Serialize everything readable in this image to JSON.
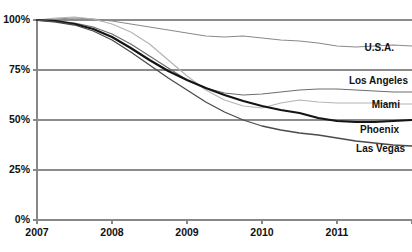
{
  "chart_data": {
    "type": "line",
    "title": "",
    "xlabel": "",
    "ylabel": "",
    "xlim": [
      2007,
      2012
    ],
    "ylim": [
      0,
      100
    ],
    "grid": true,
    "legend_position": "inline-right",
    "x_ticks": [
      "2007",
      "2008",
      "2009",
      "2010",
      "2011"
    ],
    "x_tick_values": [
      2007,
      2008,
      2009,
      2010,
      2011
    ],
    "y_ticks": [
      "0%",
      "25%",
      "50%",
      "75%",
      "100%"
    ],
    "y_tick_values": [
      0,
      25,
      50,
      75,
      100
    ],
    "x": [
      2007.0,
      2007.25,
      2007.5,
      2007.75,
      2008.0,
      2008.25,
      2008.5,
      2008.75,
      2009.0,
      2009.25,
      2009.5,
      2009.75,
      2010.0,
      2010.25,
      2010.5,
      2010.75,
      2011.0,
      2011.25,
      2011.5,
      2011.75,
      2012.0
    ],
    "series": [
      {
        "name": "U.S.A.",
        "color": "#8a8a8a",
        "width": 1.1,
        "label_value": 87,
        "values": [
          100,
          100.5,
          101,
          100.5,
          99.5,
          98,
          96.5,
          95,
          93.5,
          92,
          91.5,
          92,
          91,
          90,
          89.5,
          88.5,
          87,
          86.5,
          87,
          87.5,
          87
        ]
      },
      {
        "name": "Los Angeles",
        "color": "#6e6e6e",
        "width": 1.2,
        "label_value": 64,
        "values": [
          100,
          99.5,
          98.5,
          96.5,
          93,
          88,
          82,
          76,
          70,
          66,
          63.5,
          62.5,
          63,
          64,
          65,
          65.5,
          65.5,
          65,
          64.5,
          64,
          64
        ]
      },
      {
        "name": "Miami",
        "color": "#b4b4b4",
        "width": 1.2,
        "label_value": 58,
        "values": [
          100,
          101,
          101.5,
          100.5,
          98,
          94,
          88,
          80,
          72,
          65,
          60,
          57,
          56,
          58.5,
          60,
          59,
          58.5,
          58.5,
          58.5,
          58,
          58
        ]
      },
      {
        "name": "Phoenix",
        "color": "#141414",
        "width": 2.2,
        "label_value": 50,
        "values": [
          100,
          99.5,
          98,
          95.5,
          91.5,
          86,
          80,
          74.5,
          70,
          66,
          62.5,
          59.5,
          57,
          55,
          53.5,
          51,
          49.5,
          49,
          49,
          49.5,
          50
        ]
      },
      {
        "name": "Las Vegas",
        "color": "#4a4a4a",
        "width": 1.3,
        "label_value": 37,
        "values": [
          100,
          99,
          97.5,
          94.5,
          90,
          84,
          77.5,
          71,
          65,
          59,
          54,
          50,
          47,
          45,
          43.5,
          42.5,
          41,
          39.5,
          38.5,
          37.5,
          37
        ]
      }
    ],
    "series_labels": [
      {
        "name": "U.S.A.",
        "text": "U.S.A.",
        "x": 394,
        "y": 51
      },
      {
        "name": "Los Angeles",
        "text": "Los Angeles",
        "x": 408,
        "y": 84
      },
      {
        "name": "Miami",
        "text": "Miami",
        "x": 400,
        "y": 108
      },
      {
        "name": "Phoenix",
        "text": "Phoenix",
        "x": 399,
        "y": 133
      },
      {
        "name": "Las Vegas",
        "text": "Las Vegas",
        "x": 405,
        "y": 152
      }
    ],
    "axis_color": "#888888",
    "grid_color": "#8c8c8c",
    "text_color": "#111111",
    "background": "#ffffff"
  },
  "geometry": {
    "plot_left": 37,
    "plot_right": 412,
    "plot_top": 20,
    "plot_bottom": 220,
    "x_per_year": 75,
    "y_per_percent": 2
  }
}
